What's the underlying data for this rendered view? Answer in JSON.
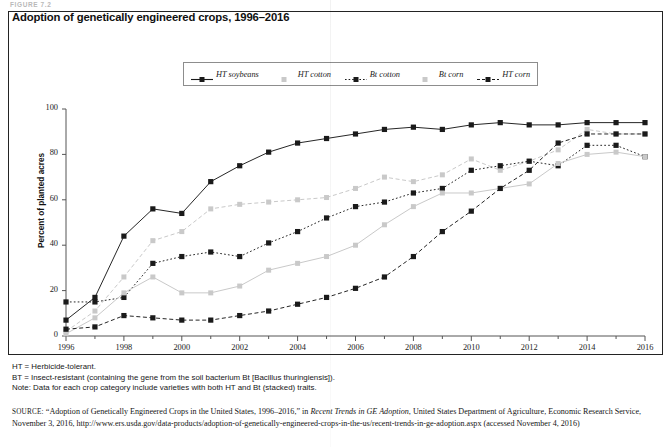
{
  "figure_label": "FIGURE 7.2",
  "chart_title": "Adoption of genetically engineered crops, 1996–2016",
  "axis": {
    "y_title": "Percent of planted acres",
    "y_ticks": [
      "0",
      "20",
      "40",
      "60",
      "80",
      "100"
    ],
    "x_ticks": [
      "1996",
      "1998",
      "2000",
      "2002",
      "2004",
      "2006",
      "2008",
      "2010",
      "2012",
      "2014",
      "2016"
    ]
  },
  "legend": {
    "items": [
      {
        "label": "HT soybeans",
        "color": "#1a1a1a",
        "dash": "solid"
      },
      {
        "label": "HT cotton",
        "color": "#c9c9c9",
        "dash": "dashed"
      },
      {
        "label": "Bt cotton",
        "color": "#1a1a1a",
        "dash": "dotted"
      },
      {
        "label": "Bt corn",
        "color": "#c9c9c9",
        "dash": "solid"
      },
      {
        "label": "HT corn",
        "color": "#1a1a1a",
        "dash": "dashed"
      }
    ]
  },
  "notes": [
    "HT = Herbicide-tolerant.",
    "BT = Insect-resistant (containing the gene from the soil bacterium Bt [Bacillus thuringiensis]).",
    "Note: Data for each crop category include varieties with both HT and Bt (stacked) traits."
  ],
  "source": {
    "prefix": "SOURCE:",
    "text_1": "“Adoption of Genetically Engineered Crops in the United States, 1996–2016,” in ",
    "italic_1": "Recent Trends in GE Adoption",
    "text_2": ", United States Department of Agriculture, Economic Research Service, November 3, 2016, http://www.ers.usda.gov/data-products/adoption-of-genetically-engineered-crops-in-the-us/recent-trends-in-ge-adoption.aspx (accessed November 4, 2016)"
  },
  "chart_data": {
    "type": "line",
    "title": "Adoption of genetically engineered crops, 1996–2016",
    "xlabel": "",
    "ylabel": "Percent of planted acres",
    "ylim": [
      0,
      100
    ],
    "xlim": [
      1996,
      2016
    ],
    "grid": false,
    "legend_position": "top-center",
    "x": [
      1996,
      1997,
      1998,
      1999,
      2000,
      2001,
      2002,
      2003,
      2004,
      2005,
      2006,
      2007,
      2008,
      2009,
      2010,
      2011,
      2012,
      2013,
      2014,
      2015,
      2016
    ],
    "series": [
      {
        "name": "HT soybeans",
        "color": "#1a1a1a",
        "dash": "solid",
        "values": [
          7,
          17,
          44,
          56,
          54,
          68,
          75,
          81,
          85,
          87,
          89,
          91,
          92,
          91,
          93,
          94,
          93,
          93,
          94,
          94,
          94
        ]
      },
      {
        "name": "HT cotton",
        "color": "#c9c9c9",
        "dash": "dashed",
        "values": [
          2,
          11,
          26,
          42,
          46,
          56,
          58,
          59,
          60,
          61,
          65,
          70,
          68,
          71,
          78,
          73,
          77,
          82,
          91,
          89,
          89
        ]
      },
      {
        "name": "Bt cotton",
        "color": "#1a1a1a",
        "dash": "dotted",
        "values": [
          15,
          15,
          17,
          32,
          35,
          37,
          35,
          41,
          46,
          52,
          57,
          59,
          63,
          65,
          73,
          75,
          77,
          75,
          84,
          84,
          79
        ]
      },
      {
        "name": "Bt corn",
        "color": "#c9c9c9",
        "dash": "solid",
        "values": [
          1,
          8,
          19,
          26,
          19,
          19,
          22,
          29,
          32,
          35,
          40,
          49,
          57,
          63,
          63,
          65,
          67,
          76,
          80,
          81,
          79
        ]
      },
      {
        "name": "HT corn",
        "color": "#1a1a1a",
        "dash": "dashed",
        "values": [
          3,
          4,
          9,
          8,
          7,
          7,
          9,
          11,
          14,
          17,
          21,
          26,
          35,
          46,
          55,
          65,
          73,
          85,
          89,
          89,
          89
        ]
      }
    ]
  }
}
